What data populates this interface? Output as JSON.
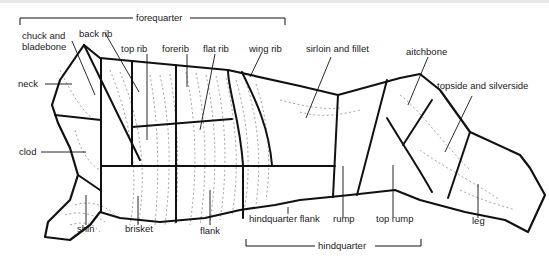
{
  "diagram": {
    "brackets": {
      "forequarter": "forequarter",
      "hindquarter": "hindquarter"
    },
    "labels": {
      "chuck_and_bladebone": "chuck and bladebone",
      "back_rib": "back rib",
      "top_rib": "top rib",
      "forerib": "forerib",
      "flat_rib": "flat rib",
      "wing_rib": "wing rib",
      "sirloin_and_fillet": "sirloin and fillet",
      "aitchbone": "aitchbone",
      "topside_and_silverside": "topside and silverside",
      "neck": "neck",
      "clod": "clod",
      "shin": "shin",
      "brisket": "brisket",
      "flank": "flank",
      "hindquarter_flank": "hindquarter flank",
      "rump": "rump",
      "top_rump": "top rump",
      "leg": "leg"
    },
    "colors": {
      "outline": "#111111",
      "texture": "#555555",
      "background": "#ffffff"
    }
  }
}
